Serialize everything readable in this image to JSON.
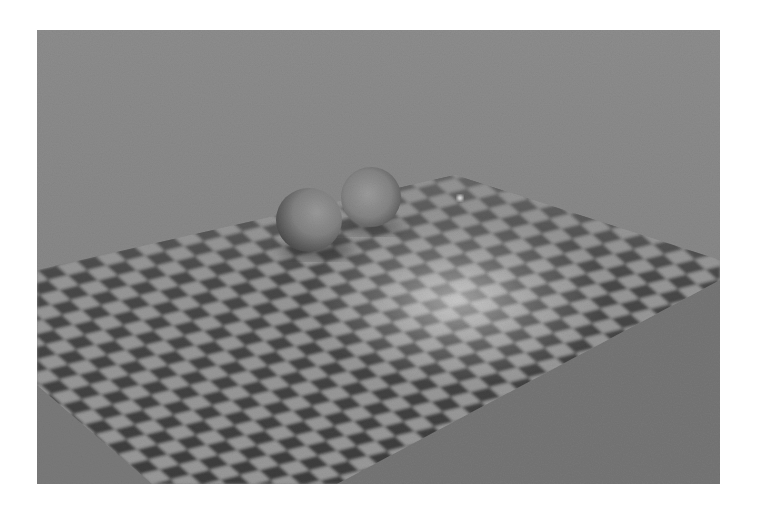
{
  "scene": {
    "description": "Ray-traced render of two spheres resting on a checkerboard plane",
    "background_color_top": "#8e8e8e",
    "background_color_bottom": "#7c7c7c",
    "floor_color": "#7a7a7a",
    "checker_dark": "#3c3c3c",
    "checker_light": "#9a9a9a",
    "sphere_color": "#808080",
    "objects": [
      {
        "type": "sphere",
        "label": "left-sphere"
      },
      {
        "type": "sphere",
        "label": "right-sphere"
      },
      {
        "type": "plane",
        "label": "checkerboard-plane"
      }
    ]
  }
}
